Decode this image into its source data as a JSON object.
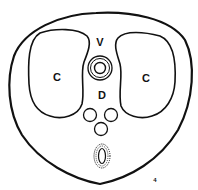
{
  "diagram": {
    "type": "cross-section",
    "colors": {
      "stroke": "#111111",
      "background": "#ffffff"
    },
    "labels": {
      "left_lobe": "C",
      "right_lobe": "C",
      "top_center": "V",
      "middle_center": "D",
      "corner_mark": "4"
    },
    "structures": [
      {
        "name": "outer-body-outline"
      },
      {
        "name": "left-lobe",
        "label": "C"
      },
      {
        "name": "right-lobe",
        "label": "C"
      },
      {
        "name": "concentric-ring",
        "label": "V"
      },
      {
        "name": "small-circle-left"
      },
      {
        "name": "small-circle-right"
      },
      {
        "name": "small-circle-bottom"
      },
      {
        "name": "dotted-oval"
      }
    ]
  }
}
